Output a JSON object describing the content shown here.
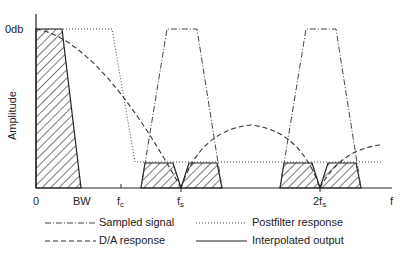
{
  "diagram": {
    "y_axis": {
      "label": "Amplitude",
      "top_tick": "0db"
    },
    "x_axis": {
      "label": "f",
      "ticks": [
        {
          "id": "zero",
          "label": "0",
          "sub": ""
        },
        {
          "id": "bw",
          "label": "BW",
          "sub": ""
        },
        {
          "id": "fc",
          "label": "f",
          "sub": "c"
        },
        {
          "id": "fs",
          "label": "f",
          "sub": "s"
        },
        {
          "id": "2fs",
          "label": "2f",
          "sub": "s"
        }
      ]
    },
    "legend": [
      {
        "style": "dash-dot",
        "label": "Sampled signal"
      },
      {
        "style": "dotted",
        "label": "Postfilter response"
      },
      {
        "style": "dashed",
        "label": "D/A response"
      },
      {
        "style": "solid",
        "label": "Interpolated output"
      }
    ],
    "colors": {
      "line": "#222222",
      "hatch": "#333333",
      "background": "#ffffff"
    }
  }
}
